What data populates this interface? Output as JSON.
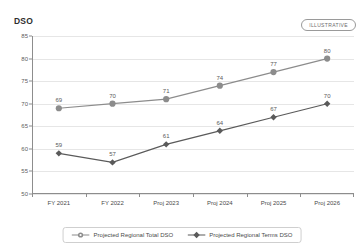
{
  "title": "DSO",
  "badge": "ILLUSTRATIVE",
  "colors": {
    "total_dso": "#8c8c8c",
    "terms_dso": "#5a5a5a",
    "grid": "#e6e6e6",
    "axis": "#8d8d8d",
    "text": "#4a4a4a"
  },
  "chart_data": {
    "type": "line",
    "title": "DSO",
    "xlabel": "",
    "ylabel": "DSO",
    "ylim": [
      50,
      85
    ],
    "yticks": [
      50,
      55,
      60,
      65,
      70,
      75,
      80,
      85
    ],
    "grid": true,
    "legend_position": "bottom",
    "annotations": [
      "ILLUSTRATIVE"
    ],
    "categories": [
      "FY 2021",
      "FY 2022",
      "Proj 2023",
      "Proj 2024",
      "Proj 2025",
      "Proj 2026"
    ],
    "series": [
      {
        "name": "Projected Regional Total DSO",
        "marker": "circle",
        "color": "#8c8c8c",
        "values": [
          69,
          70,
          71,
          74,
          77,
          80
        ]
      },
      {
        "name": "Projected Regional Terms DSO",
        "marker": "diamond",
        "color": "#5a5a5a",
        "values": [
          59,
          57,
          61,
          64,
          67,
          70
        ]
      }
    ]
  }
}
